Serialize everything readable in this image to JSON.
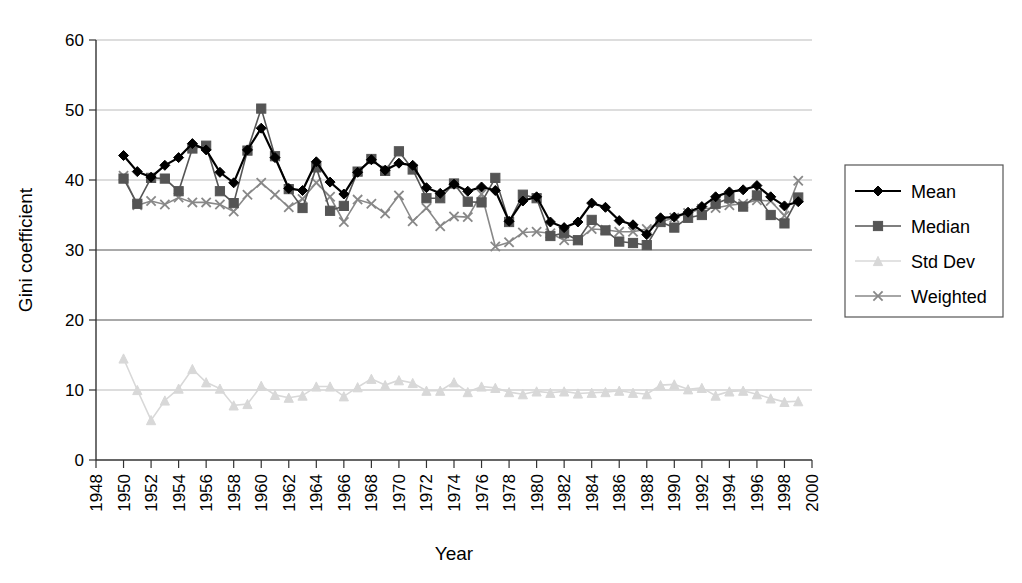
{
  "chart_data": {
    "type": "line",
    "title": "",
    "xlabel": "Year",
    "ylabel": "Gini coefficient",
    "xlim": [
      1948,
      2000
    ],
    "ylim": [
      0,
      60
    ],
    "yticks": [
      0,
      10,
      20,
      30,
      40,
      50,
      60
    ],
    "xticks": [
      1948,
      1950,
      1952,
      1954,
      1956,
      1958,
      1960,
      1962,
      1964,
      1966,
      1968,
      1970,
      1972,
      1974,
      1976,
      1978,
      1980,
      1982,
      1984,
      1986,
      1988,
      1990,
      1992,
      1994,
      1996,
      1998,
      2000
    ],
    "grid": "horizontal",
    "legend_position": "right",
    "x": [
      1950,
      1951,
      1952,
      1953,
      1954,
      1955,
      1956,
      1957,
      1958,
      1959,
      1960,
      1961,
      1962,
      1963,
      1964,
      1965,
      1966,
      1967,
      1968,
      1969,
      1970,
      1971,
      1972,
      1973,
      1974,
      1975,
      1976,
      1977,
      1978,
      1979,
      1980,
      1981,
      1982,
      1983,
      1984,
      1985,
      1986,
      1987,
      1988,
      1989,
      1990,
      1991,
      1992,
      1993,
      1994,
      1995,
      1996,
      1997,
      1998,
      1999
    ],
    "series": [
      {
        "name": "Mean",
        "color": "#000000",
        "marker": "diamond",
        "values": [
          43.5,
          41.2,
          40.4,
          42.1,
          43.2,
          45.2,
          44.3,
          41.1,
          39.6,
          44.3,
          47.4,
          43.2,
          38.8,
          38.5,
          42.6,
          39.7,
          38.0,
          41.1,
          42.9,
          41.4,
          42.4,
          42.1,
          38.9,
          38.1,
          39.4,
          38.4,
          39.0,
          38.5,
          34.1,
          37.0,
          37.6,
          34.0,
          33.2,
          34.0,
          36.7,
          36.1,
          34.2,
          33.6,
          32.2,
          34.6,
          34.7,
          35.4,
          36.2,
          37.6,
          38.3,
          38.6,
          39.2,
          37.6,
          36.3,
          36.9
        ]
      },
      {
        "name": "Median",
        "color": "#555555",
        "marker": "square",
        "values": [
          40.2,
          36.6,
          40.3,
          40.2,
          38.4,
          44.5,
          44.9,
          38.4,
          36.7,
          44.2,
          50.2,
          43.4,
          38.7,
          36.0,
          41.8,
          35.6,
          36.3,
          41.2,
          43.0,
          41.3,
          44.1,
          41.5,
          37.4,
          37.4,
          39.5,
          36.9,
          36.8,
          40.3,
          34.0,
          37.9,
          37.4,
          32.0,
          32.4,
          31.4,
          34.3,
          32.8,
          31.2,
          31.0,
          30.7,
          34.0,
          33.2,
          34.6,
          35.0,
          36.6,
          37.4,
          36.2,
          37.8,
          35.0,
          33.8,
          37.5
        ]
      },
      {
        "name": "Std Dev",
        "color": "#d8d8d8",
        "marker": "triangle",
        "values": [
          14.5,
          10.0,
          5.7,
          8.5,
          10.2,
          13.0,
          11.1,
          10.2,
          7.8,
          8.0,
          10.6,
          9.3,
          8.9,
          9.2,
          10.5,
          10.5,
          9.1,
          10.4,
          11.6,
          10.7,
          11.4,
          11.0,
          9.9,
          9.9,
          11.1,
          9.7,
          10.5,
          10.3,
          9.7,
          9.4,
          9.8,
          9.6,
          9.8,
          9.5,
          9.6,
          9.7,
          9.9,
          9.6,
          9.4,
          10.7,
          10.8,
          10.1,
          10.3,
          9.2,
          9.8,
          9.9,
          9.4,
          8.8,
          8.3,
          8.4
        ]
      },
      {
        "name": "Weighted",
        "color": "#888888",
        "marker": "cross",
        "values": [
          40.6,
          36.4,
          37.0,
          36.5,
          37.5,
          36.8,
          36.8,
          36.5,
          35.5,
          37.9,
          39.6,
          37.9,
          36.1,
          37.3,
          39.6,
          37.6,
          34.0,
          37.2,
          36.6,
          35.2,
          37.8,
          34.1,
          36.0,
          33.4,
          34.8,
          34.7,
          38.0,
          30.5,
          31.1,
          32.5,
          32.6,
          32.4,
          31.4,
          31.4,
          33.0,
          32.9,
          32.6,
          32.6,
          33.0,
          34.0,
          34.6,
          35.3,
          35.9,
          36.0,
          36.4,
          36.6,
          37.1,
          37.0,
          34.9,
          39.9
        ]
      }
    ]
  },
  "legend": {
    "items": [
      {
        "label": "Mean"
      },
      {
        "label": "Median"
      },
      {
        "label": "Std Dev"
      },
      {
        "label": "Weighted"
      }
    ]
  }
}
